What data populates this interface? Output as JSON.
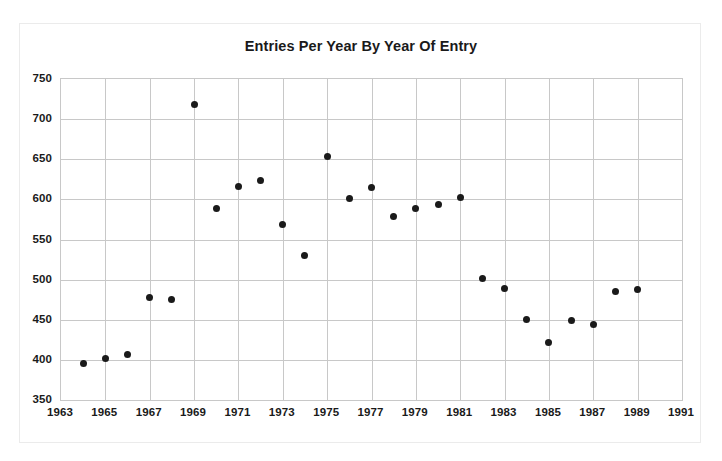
{
  "figure": {
    "top_caption": "",
    "frame_border_color": "#ebebeb",
    "background_color": "#ffffff"
  },
  "chart_data": {
    "type": "scatter",
    "title": "Entries Per Year By Year Of Entry",
    "xlabel": "",
    "ylabel": "",
    "xlim": [
      1963,
      1991
    ],
    "ylim": [
      350,
      750
    ],
    "grid": true,
    "legend": null,
    "marker_color": "#1a1a1a",
    "grid_color": "#c8c8c8",
    "x_tick_labels": [
      "1963",
      "1965",
      "1967",
      "1969",
      "1971",
      "1973",
      "1975",
      "1977",
      "1979",
      "1981",
      "1983",
      "1985",
      "1987",
      "1989",
      "1991"
    ],
    "x_ticks": [
      1963,
      1965,
      1967,
      1969,
      1971,
      1973,
      1975,
      1977,
      1979,
      1981,
      1983,
      1985,
      1987,
      1989,
      1991
    ],
    "y_tick_labels": [
      "350",
      "400",
      "450",
      "500",
      "550",
      "600",
      "650",
      "700",
      "750"
    ],
    "y_ticks": [
      350,
      400,
      450,
      500,
      550,
      600,
      650,
      700,
      750
    ],
    "x": [
      1964,
      1965,
      1966,
      1967,
      1968,
      1969,
      1970,
      1971,
      1972,
      1973,
      1974,
      1975,
      1976,
      1977,
      1978,
      1979,
      1980,
      1981,
      1982,
      1983,
      1984,
      1985,
      1986,
      1987,
      1988,
      1989
    ],
    "values": [
      395,
      402,
      407,
      478,
      475,
      718,
      589,
      616,
      623,
      569,
      530,
      653,
      601,
      615,
      579,
      589,
      594,
      602,
      502,
      489,
      450,
      422,
      449,
      444,
      485,
      488
    ],
    "points": [
      {
        "x": 1964,
        "y": 395
      },
      {
        "x": 1965,
        "y": 402
      },
      {
        "x": 1966,
        "y": 407
      },
      {
        "x": 1967,
        "y": 478
      },
      {
        "x": 1968,
        "y": 475
      },
      {
        "x": 1969,
        "y": 718
      },
      {
        "x": 1970,
        "y": 589
      },
      {
        "x": 1971,
        "y": 616
      },
      {
        "x": 1972,
        "y": 623
      },
      {
        "x": 1973,
        "y": 569
      },
      {
        "x": 1974,
        "y": 530
      },
      {
        "x": 1975,
        "y": 653
      },
      {
        "x": 1976,
        "y": 601
      },
      {
        "x": 1977,
        "y": 615
      },
      {
        "x": 1978,
        "y": 579
      },
      {
        "x": 1979,
        "y": 589
      },
      {
        "x": 1980,
        "y": 594
      },
      {
        "x": 1981,
        "y": 602
      },
      {
        "x": 1982,
        "y": 502
      },
      {
        "x": 1983,
        "y": 489
      },
      {
        "x": 1984,
        "y": 450
      },
      {
        "x": 1985,
        "y": 422
      },
      {
        "x": 1986,
        "y": 449
      },
      {
        "x": 1987,
        "y": 444
      },
      {
        "x": 1988,
        "y": 485
      },
      {
        "x": 1989,
        "y": 488
      }
    ]
  }
}
